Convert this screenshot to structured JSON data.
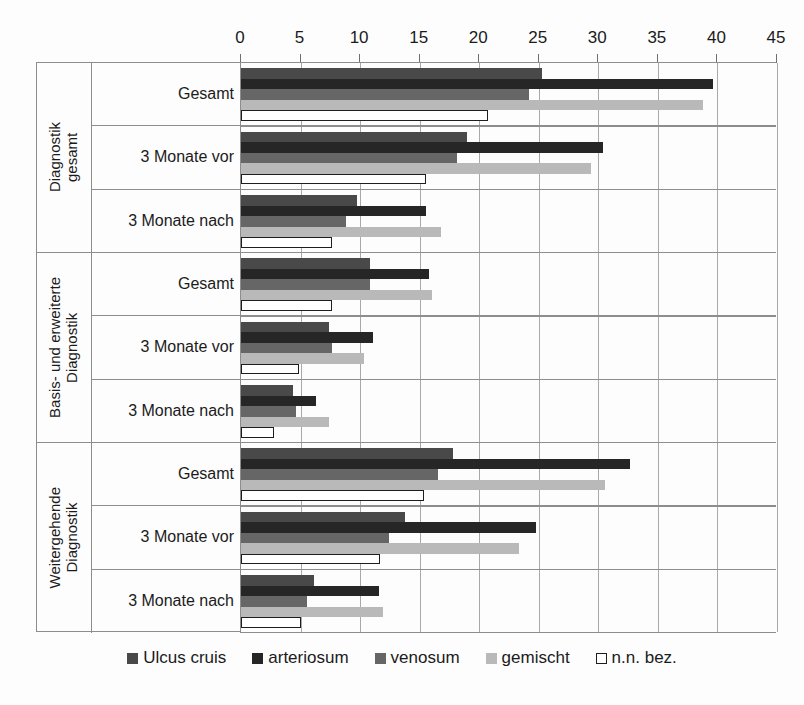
{
  "chart_data": {
    "type": "bar",
    "orientation": "horizontal",
    "title": "",
    "xlabel": "",
    "ylabel": "",
    "xlim": [
      0,
      45
    ],
    "xticks": [
      0,
      5,
      10,
      15,
      20,
      25,
      30,
      35,
      40,
      45
    ],
    "grid": true,
    "legend_position": "bottom",
    "group_labels": [
      "Diagnostik\ngesamt",
      "Basis- und erweiterte\nDiagnostik",
      "Weitergehende\nDiagnostik"
    ],
    "categories": [
      "Gesamt",
      "3 Monate vor",
      "3 Monate nach",
      "Gesamt",
      "3 Monate vor",
      "3 Monate nach",
      "Gesamt",
      "3 Monate vor",
      "3 Monate nach"
    ],
    "series": [
      {
        "name": "Ulcus cruis",
        "color": "#494949",
        "values": [
          25.3,
          19.0,
          9.7,
          10.8,
          7.4,
          4.4,
          17.8,
          13.8,
          6.1
        ]
      },
      {
        "name": "arteriosum",
        "color": "#262626",
        "values": [
          39.6,
          30.4,
          15.5,
          15.8,
          11.1,
          6.3,
          32.7,
          24.8,
          11.6
        ]
      },
      {
        "name": "venosum",
        "color": "#666666",
        "values": [
          24.2,
          18.1,
          8.8,
          10.8,
          7.6,
          4.6,
          16.5,
          12.4,
          5.5
        ]
      },
      {
        "name": "gemischt",
        "color": "#b9b9b9",
        "values": [
          38.8,
          29.4,
          16.8,
          16.0,
          10.3,
          7.4,
          30.6,
          23.3,
          11.9
        ]
      },
      {
        "name": "n.n. bez.",
        "color": "#ffffff",
        "values": [
          20.7,
          15.5,
          7.6,
          7.6,
          4.9,
          2.8,
          15.4,
          11.7,
          5.0
        ]
      }
    ]
  },
  "legend": {
    "items": [
      {
        "label": "Ulcus cruis",
        "swatch": "#494949"
      },
      {
        "label": "arteriosum",
        "swatch": "#262626"
      },
      {
        "label": "venosum",
        "swatch": "#666666"
      },
      {
        "label": "gemischt",
        "swatch": "#b9b9b9"
      },
      {
        "label": "n.n. bez.",
        "swatch": "#ffffff"
      }
    ]
  }
}
